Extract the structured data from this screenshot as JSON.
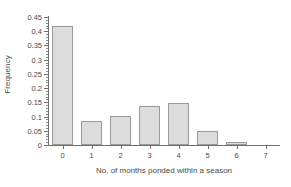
{
  "chart_data": {
    "type": "bar",
    "title": "",
    "xlabel": "No. of months ponded within a season",
    "ylabel": "Frequency",
    "categories": [
      "0",
      "1",
      "2",
      "3",
      "4",
      "5",
      "6",
      "7"
    ],
    "values": [
      0.42,
      0.086,
      0.103,
      0.137,
      0.147,
      0.048,
      0.009,
      0
    ],
    "ylim": [
      0,
      0.45
    ],
    "xlim": [
      -0.5,
      7.5
    ],
    "y_ticks": [
      "0",
      "0.05",
      "0.1",
      "0.15",
      "0.2",
      "0.25",
      "0.3",
      "0.35",
      "0.4",
      "0.45"
    ],
    "y_tick_values": [
      0,
      0.05,
      0.1,
      0.15,
      0.2,
      0.25,
      0.3,
      0.35,
      0.4,
      0.45
    ],
    "y_minor_tick_interval": 0.01,
    "grid": false,
    "legend": null,
    "legend_position": "none",
    "bar_fill_color": "#dcdcdc",
    "bar_border_color": "#9a9a9a",
    "axis_color": "#6e6e6e",
    "text_color": "#4a4a4a",
    "background_color": "#ffffff"
  }
}
